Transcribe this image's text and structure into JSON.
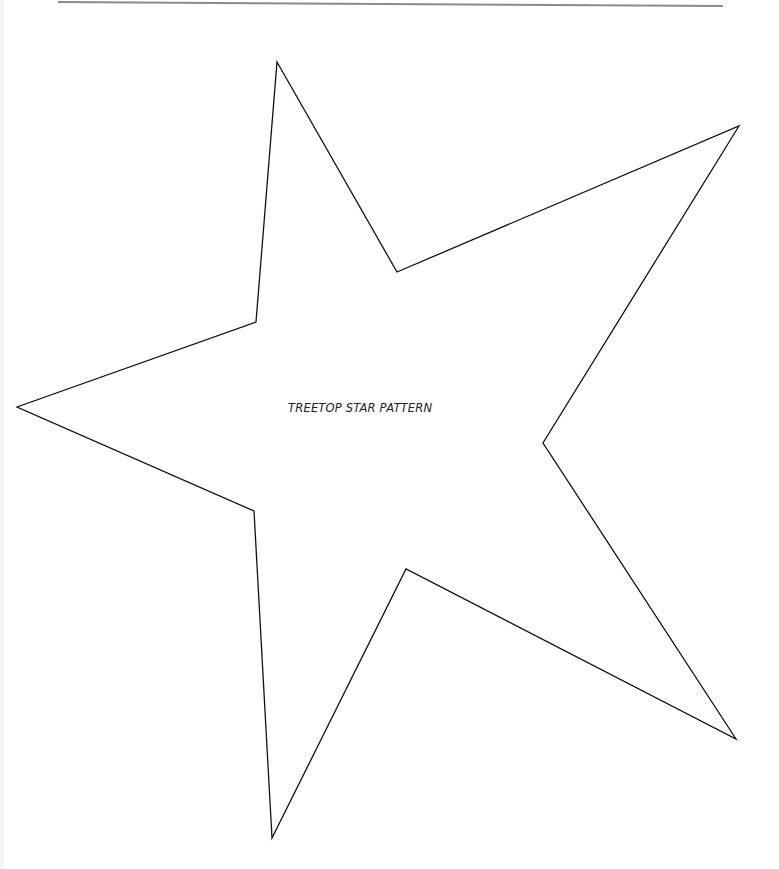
{
  "document": {
    "title": "TREETOP STAR PATTERN",
    "colors": {
      "background": "#ffffff",
      "outline": "#111111",
      "rule": "#8a8a8a",
      "text": "#222222"
    },
    "header_rule": {
      "x1": 58,
      "y1": 2,
      "x2": 723,
      "y2": 6
    },
    "star_outline": {
      "points": [
        [
          277,
          62
        ],
        [
          397,
          272
        ],
        [
          739,
          126
        ],
        [
          543,
          443
        ],
        [
          736,
          739
        ],
        [
          406,
          569
        ],
        [
          272,
          838
        ],
        [
          254,
          511
        ],
        [
          17,
          407
        ],
        [
          256,
          322
        ]
      ]
    }
  }
}
